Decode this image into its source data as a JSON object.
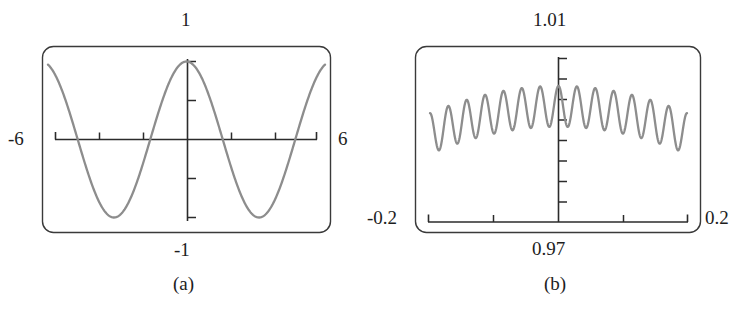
{
  "figure": {
    "kind": "two-panel-graphing-calculator-plot",
    "background": "#ffffff",
    "ink_color": "#2b2b2b",
    "curve_color": "#8a8a8a"
  },
  "panels": [
    {
      "id": "a",
      "caption": "(a)",
      "labels": {
        "top": "1",
        "bottom": "-1",
        "left": "-6",
        "right": "6"
      },
      "window": {
        "xmin": -6,
        "xmax": 6,
        "ymin": -1,
        "ymax": 1
      },
      "axes": {
        "x_axis_at_y": 0,
        "y_axis_at_x": 0,
        "x_tick_count": 4,
        "y_tick_count": 4,
        "x_tick_values": [
          -4,
          -2,
          2,
          4
        ],
        "y_tick_values": [
          -1,
          -0.5,
          0.5,
          1
        ],
        "has_end_caps": true
      }
    },
    {
      "id": "b",
      "caption": "(b)",
      "labels": {
        "top": "1.01",
        "bottom": "0.97",
        "left": "-0.2",
        "right": "0.2"
      },
      "window": {
        "xmin": -0.2,
        "xmax": 0.2,
        "ymin": 0.97,
        "ymax": 1.01
      },
      "axes": {
        "x_axis_at_y": 0.97,
        "y_axis_at_x": 0,
        "x_tick_count": 2,
        "y_tick_count": 8,
        "x_tick_values": [
          -0.1,
          0.1
        ],
        "has_end_caps": true
      }
    }
  ],
  "chart_data": [
    {
      "type": "line",
      "title": "(a)",
      "xlabel": "",
      "ylabel": "",
      "xlim": [
        -6,
        6
      ],
      "ylim": [
        -1,
        1
      ],
      "grid": false,
      "legend": "none",
      "series": [
        {
          "name": "cos x",
          "expression": "y = cos(x)",
          "x": [
            -6.0,
            -5.8,
            -5.6,
            -5.4,
            -5.2,
            -5.0,
            -4.8,
            -4.6,
            -4.4,
            -4.2,
            -4.0,
            -3.8,
            -3.6,
            -3.4,
            -3.2,
            -3.0,
            -2.8,
            -2.6,
            -2.4,
            -2.2,
            -2.0,
            -1.8,
            -1.6,
            -1.4,
            -1.2,
            -1.0,
            -0.8,
            -0.6,
            -0.4,
            -0.2,
            0.0,
            0.2,
            0.4,
            0.6,
            0.8,
            1.0,
            1.2,
            1.4,
            1.6,
            1.8,
            2.0,
            2.2,
            2.4,
            2.6,
            2.8,
            3.0,
            3.2,
            3.4,
            3.6,
            3.8,
            4.0,
            4.2,
            4.4,
            4.6,
            4.8,
            5.0,
            5.2,
            5.4,
            5.6,
            5.8,
            6.0
          ],
          "y": [
            0.96,
            0.886,
            0.776,
            0.635,
            0.469,
            0.284,
            0.087,
            -0.112,
            -0.307,
            -0.49,
            -0.654,
            -0.791,
            -0.897,
            -0.967,
            -0.998,
            -0.99,
            -0.942,
            -0.857,
            -0.737,
            -0.589,
            -0.416,
            -0.227,
            -0.029,
            0.17,
            0.362,
            0.54,
            0.697,
            0.825,
            0.921,
            0.98,
            1.0,
            0.98,
            0.921,
            0.825,
            0.697,
            0.54,
            0.362,
            0.17,
            -0.029,
            -0.227,
            -0.416,
            -0.589,
            -0.737,
            -0.857,
            -0.942,
            -0.99,
            -0.998,
            -0.967,
            -0.897,
            -0.791,
            -0.654,
            -0.49,
            -0.307,
            -0.112,
            0.087,
            0.284,
            0.469,
            0.635,
            0.776,
            0.886,
            0.96
          ]
        }
      ]
    },
    {
      "type": "line",
      "title": "(b)",
      "xlabel": "",
      "ylabel": "",
      "xlim": [
        -0.2,
        0.2
      ],
      "ylim": [
        0.97,
        1.01
      ],
      "grid": false,
      "legend": "none",
      "series": [
        {
          "name": "cos x + ripple",
          "expression": "y = cos(x) + 0.004 cos(90x)",
          "note": "zoomed view near x = 0 showing a high-frequency ripple riding on the cosine peak"
        }
      ]
    }
  ]
}
